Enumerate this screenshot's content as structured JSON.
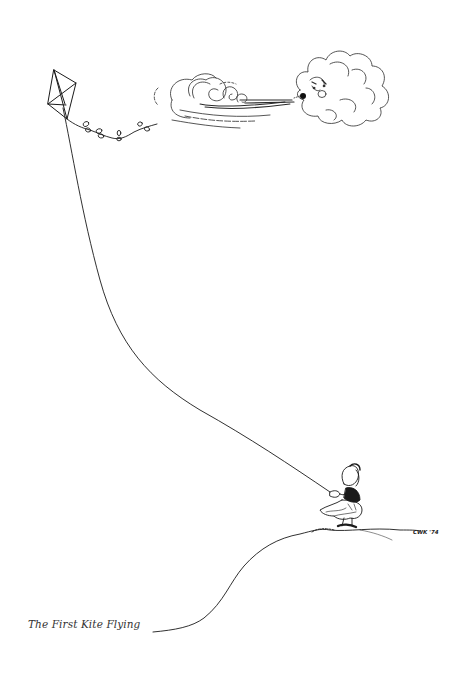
{
  "illustration": {
    "caption": "The First Kite Flying",
    "signature": "CWK '74",
    "elements": [
      "kite",
      "kite-tail-bows",
      "wind-gust",
      "blowing-cloud-face",
      "kite-string",
      "child-flying-kite",
      "hill"
    ],
    "colors": {
      "ink": "#1a1a1a",
      "background": "#ffffff",
      "caption": "#333333"
    }
  }
}
